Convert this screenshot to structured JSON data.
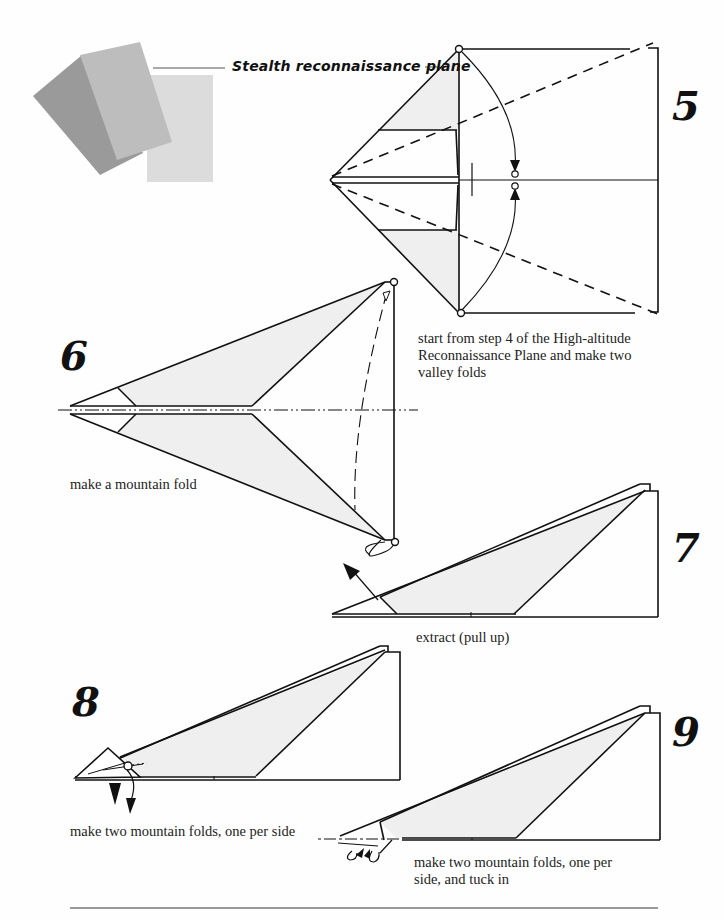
{
  "header": {
    "title": "Stealth reconnaissance plane",
    "paper_swatches": [
      {
        "name": "dark-gray-sheet",
        "color": "#9a9a9a"
      },
      {
        "name": "mid-gray-sheet",
        "color": "#bdbdbd"
      },
      {
        "name": "light-gray-sheet",
        "color": "#dcdcdc"
      }
    ]
  },
  "colors": {
    "line": "#111111",
    "fill": "#efefef",
    "background": "#fefefe"
  },
  "steps": [
    {
      "number": "5",
      "caption": "start from step 4 of the High-altitude Reconnaissance Plane and make two valley folds",
      "caption_lines": [
        "start from step 4 of the High-altitude",
        "Reconnaissance Plane and make two",
        "valley folds"
      ]
    },
    {
      "number": "6",
      "caption": "make a mountain fold"
    },
    {
      "number": "7",
      "caption": "extract (pull up)"
    },
    {
      "number": "8",
      "caption": "make two mountain folds, one per side"
    },
    {
      "number": "9",
      "caption": "make two mountain folds, one per side, and tuck in",
      "caption_lines": [
        "make two mountain folds, one per",
        "side, and tuck in"
      ]
    }
  ]
}
